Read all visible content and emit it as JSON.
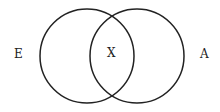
{
  "diagram": {
    "type": "venn",
    "sets": [
      {
        "label": "E",
        "cx": 87,
        "cy": 56,
        "r": 47
      },
      {
        "label": "A",
        "cx": 137,
        "cy": 56,
        "r": 47
      }
    ],
    "intersection_label": "X",
    "labels": {
      "left": "E",
      "center": "X",
      "right": "A"
    },
    "stroke_color": "#222222"
  }
}
